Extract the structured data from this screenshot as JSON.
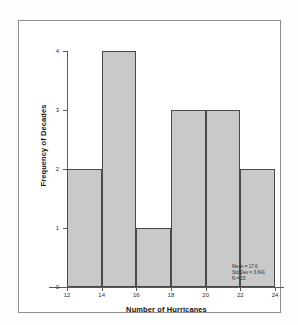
{
  "figure": {
    "background_color": "#ffffff",
    "frame_color": "#8e8e8e"
  },
  "chart_data": {
    "type": "bar",
    "title": "",
    "subtitle": "",
    "xlabel": "Number of Hurricanes",
    "ylabel": "Frequency of Decades",
    "categories": [
      "12-14",
      "14-16",
      "16-18",
      "18-20",
      "20-22",
      "22-24"
    ],
    "bin_edges": [
      12,
      14,
      16,
      18,
      20,
      22,
      24
    ],
    "values": [
      2,
      4,
      1,
      3,
      3,
      2
    ],
    "xlim": [
      12,
      24
    ],
    "ylim": [
      0,
      4
    ],
    "x_ticks": [
      "12",
      "14",
      "16",
      "18",
      "20",
      "22",
      "24"
    ],
    "x_tick_values": [
      12,
      14,
      16,
      18,
      20,
      22,
      24
    ],
    "y_ticks": [
      "0",
      "1",
      "2",
      "3",
      "4"
    ],
    "y_tick_values": [
      0,
      1,
      2,
      3,
      4
    ],
    "grid": false,
    "legend": "none",
    "bar_fill_color": "#c9c9c9",
    "bar_edge_color": "#4a4a4a",
    "axis_color": "#5a5a5a",
    "annotations": [
      "Mean = 17.6",
      "Std Dev = 3.641",
      "N = 15"
    ]
  },
  "stats": {
    "mean_line": "Mean = 17.6",
    "stddev_line": "Std Dev = 3.641",
    "n_line": "N = 15"
  }
}
